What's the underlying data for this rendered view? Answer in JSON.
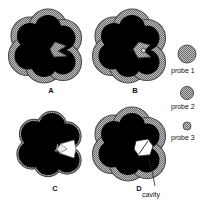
{
  "figure": {
    "background_color": "#ffffff",
    "colors": {
      "atom_fill": "#000000",
      "shell_fill": "#9b9b9b",
      "shell_edge": "#555555",
      "cavity_fill": "#ffffff",
      "text": "#111111",
      "leader_line": "#222222"
    }
  },
  "panels": [
    {
      "id": "A",
      "label": "A",
      "description": "black atom cluster with thick gray probe shell, cleft filled with gray"
    },
    {
      "id": "B",
      "label": "B",
      "description": "black atom cluster with gray probe shell and small probe sphere seated in cleft"
    },
    {
      "id": "C",
      "label": "C",
      "description": "black atom cluster with thin gray shell and open cleft"
    },
    {
      "id": "D",
      "label": "D",
      "description": "black atom cluster with gray shell enclosing a white interior cavity"
    }
  ],
  "legend": {
    "items": [
      {
        "label": "probe 1",
        "radius_px": 9.0,
        "icon": "probe-circle-large"
      },
      {
        "label": "probe 2",
        "radius_px": 6.5,
        "icon": "probe-circle-medium"
      },
      {
        "label": "probe 3",
        "radius_px": 4.0,
        "icon": "probe-circle-small"
      }
    ]
  },
  "annotations": [
    {
      "label": "cavity",
      "target_panel": "D",
      "icon": "leader-line"
    }
  ]
}
